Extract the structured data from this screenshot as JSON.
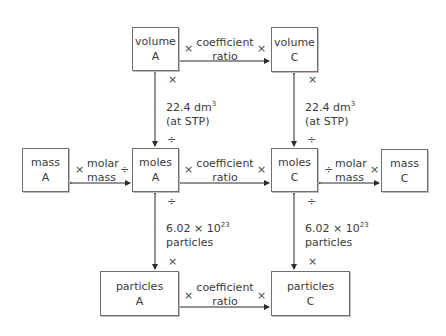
{
  "boxes": {
    "volume_a": {
      "line1": "volume",
      "line2": "A"
    },
    "volume_c": {
      "line1": "volume",
      "line2": "C"
    },
    "mass_a": {
      "line1": "mass",
      "line2": "A"
    },
    "moles_a": {
      "line1": "moles",
      "line2": "A"
    },
    "moles_c": {
      "line1": "moles",
      "line2": "C"
    },
    "mass_c": {
      "line1": "mass",
      "line2": "C"
    },
    "particles_a": {
      "line1": "particles",
      "line2": "A"
    },
    "particles_c": {
      "line1": "particles",
      "line2": "C"
    }
  },
  "labels": {
    "coefficient_top": {
      "line1": "coefficient",
      "line2": "ratio"
    },
    "coefficient_mid": {
      "line1": "coefficient",
      "line2": "ratio"
    },
    "coefficient_bottom": {
      "line1": "coefficient",
      "line2": "ratio"
    },
    "molar_mass_left": {
      "line1": "molar",
      "line2": "mass"
    },
    "molar_mass_right": {
      "line1": "molar",
      "line2": "mass"
    },
    "gas_volume_left": {
      "line1_base": "22.4 dm",
      "line1_sup": "3",
      "line2": "(at STP)"
    },
    "gas_volume_right": {
      "line1_base": "22.4 dm",
      "line1_sup": "3",
      "line2": "(at STP)"
    },
    "avogadro_left": {
      "line1_base": "6.02 × 10",
      "line1_sup": "23",
      "line2": "particles"
    },
    "avogadro_right": {
      "line1_base": "6.02 × 10",
      "line1_sup": "23",
      "line2": "particles"
    }
  },
  "operators": {
    "multiply": "×",
    "divide": "÷"
  },
  "colors": {
    "line": "#2b2b2b",
    "box_border": "#6e6e6e",
    "text": "#3a3a3a"
  }
}
